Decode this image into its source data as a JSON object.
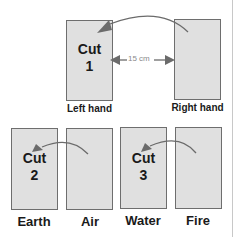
{
  "top_row": {
    "left_card": {
      "label": "Left hand",
      "cut": {
        "title": "Cut",
        "number": "1"
      }
    },
    "right_card": {
      "label": "Right hand"
    },
    "distance_label": "15 cm"
  },
  "bottom_row": {
    "cards": [
      {
        "label": "Earth",
        "cut": {
          "title": "Cut",
          "number": "2"
        }
      },
      {
        "label": "Air"
      },
      {
        "label": "Water",
        "cut": {
          "title": "Cut",
          "number": "3"
        }
      },
      {
        "label": "Fire"
      }
    ]
  },
  "colors": {
    "card_fill": "#e0e0e0",
    "card_border": "#6e6e6e",
    "arrow": "#6b6b6b",
    "text": "#1a1a1a"
  }
}
